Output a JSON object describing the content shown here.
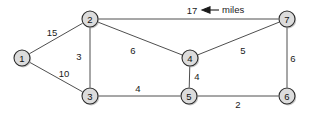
{
  "diagram": {
    "units_annotation": {
      "label": "miles",
      "icon": "left-arrow-icon",
      "points_to_edge": "2-7"
    },
    "colors": {
      "node_fill": "#dcdcdc",
      "node_stroke": "#2b2b2b",
      "edge_stroke": "#3a3a3a",
      "text": "#1a1a1a",
      "background": "#ffffff"
    },
    "nodes": [
      {
        "id": "1",
        "label": "1",
        "x": 22,
        "y": 58,
        "r": 8
      },
      {
        "id": "2",
        "label": "2",
        "x": 90,
        "y": 19,
        "r": 8
      },
      {
        "id": "3",
        "label": "3",
        "x": 90,
        "y": 96,
        "r": 8
      },
      {
        "id": "4",
        "label": "4",
        "x": 190,
        "y": 58,
        "r": 8
      },
      {
        "id": "5",
        "label": "5",
        "x": 189,
        "y": 96,
        "r": 8
      },
      {
        "id": "6",
        "label": "6",
        "x": 287,
        "y": 96,
        "r": 8
      },
      {
        "id": "7",
        "label": "7",
        "x": 287,
        "y": 19,
        "r": 8
      }
    ],
    "edges": [
      {
        "from": "1",
        "to": "2",
        "weight": "15",
        "lx": 52,
        "ly": 32
      },
      {
        "from": "1",
        "to": "3",
        "weight": "10",
        "lx": 64,
        "ly": 73
      },
      {
        "from": "2",
        "to": "3",
        "weight": "3",
        "lx": 79,
        "ly": 56
      },
      {
        "from": "2",
        "to": "4",
        "weight": "6",
        "lx": 133,
        "ly": 50
      },
      {
        "from": "2",
        "to": "7",
        "weight": "17",
        "lx": 192,
        "ly": 10
      },
      {
        "from": "3",
        "to": "5",
        "weight": "4",
        "lx": 138,
        "ly": 88
      },
      {
        "from": "4",
        "to": "5",
        "weight": "4",
        "lx": 197,
        "ly": 76
      },
      {
        "from": "4",
        "to": "7",
        "weight": "5",
        "lx": 243,
        "ly": 50
      },
      {
        "from": "5",
        "to": "6",
        "weight": "2",
        "lx": 238,
        "ly": 104
      },
      {
        "from": "6",
        "to": "7",
        "weight": "6",
        "lx": 293,
        "ly": 58
      }
    ],
    "annotation": {
      "text": "miles",
      "text_x": 222,
      "text_y": 9,
      "arrow_tip_x": 202,
      "arrow_tip_y": 10,
      "arrow_tail_x": 219,
      "arrow_tail_y": 10
    }
  }
}
